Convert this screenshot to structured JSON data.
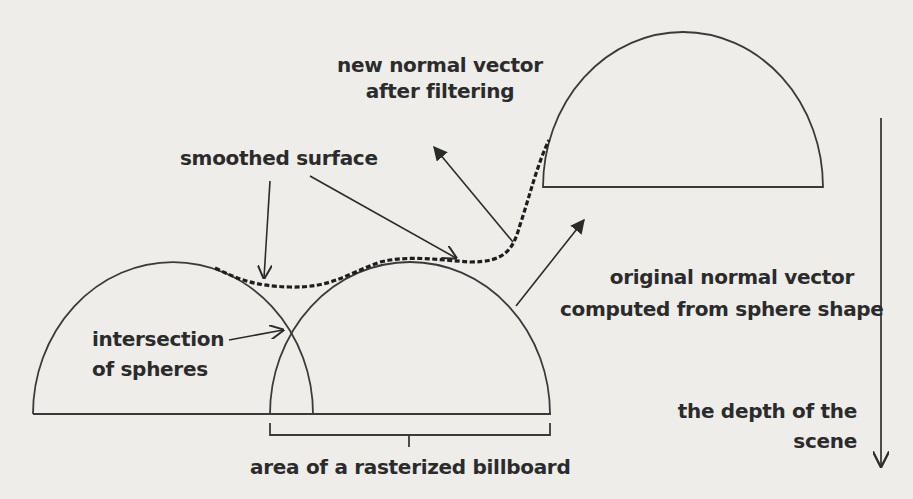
{
  "diagram": {
    "labels": {
      "new_normal_line1": "new normal vector",
      "new_normal_line2": "after filtering",
      "smoothed_surface": "smoothed surface",
      "original_normal_line1": "original normal vector",
      "original_normal_line2": "computed from sphere shape",
      "intersection_line1": "intersection",
      "intersection_line2": "of spheres",
      "depth_line1": "the depth of the",
      "depth_line2": "scene",
      "billboard_area": "area of a rasterized billboard"
    },
    "colors": {
      "background": "#eeedea",
      "stroke": "#3a3a3a",
      "text": "#2b2b2b"
    }
  }
}
